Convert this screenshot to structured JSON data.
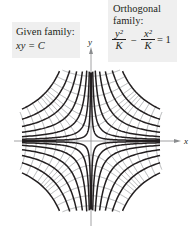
{
  "given_family": {
    "label": "Given family:",
    "equation": "xy = C"
  },
  "orthogonal_family": {
    "label_line1": "Orthogonal",
    "label_line2": "family:",
    "term1_num": "y²",
    "term1_den": "K",
    "minus": "−",
    "term2_num": "x²",
    "term2_den": "K",
    "equals": "= 1"
  },
  "axes": {
    "x_label": "x",
    "y_label": "y"
  },
  "colors": {
    "given_curves": "#231f20",
    "orthogonal_curves": "#a7a9ac",
    "axes": "#8a8c8e",
    "label_bg": "#efefef"
  },
  "plot": {
    "given_C_values": [
      0.3,
      1.2,
      3,
      6,
      10,
      15,
      22
    ],
    "orthogonal_K_values": [
      2,
      6,
      12,
      20,
      30,
      42,
      52
    ],
    "domain": 7.1,
    "center_px": [
      91,
      141
    ],
    "scale_px": 10
  }
}
